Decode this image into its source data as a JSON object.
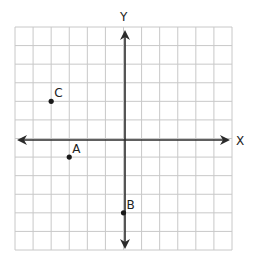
{
  "diagram": {
    "type": "coordinate-plane",
    "grid": {
      "x_range": [
        -6,
        6
      ],
      "y_range": [
        -6,
        6
      ],
      "step": 1,
      "gridlines": true
    },
    "axes": {
      "x_label": "X",
      "y_label": "Y"
    },
    "points": [
      {
        "label": "A",
        "x": -3,
        "y": -1
      },
      {
        "label": "B",
        "x": 0,
        "y": -4
      },
      {
        "label": "C",
        "x": -4,
        "y": 2
      }
    ],
    "colors": {
      "grid": "#c8c8c8",
      "axis": "#2b2b2b",
      "point": "#1a1a1a"
    }
  }
}
